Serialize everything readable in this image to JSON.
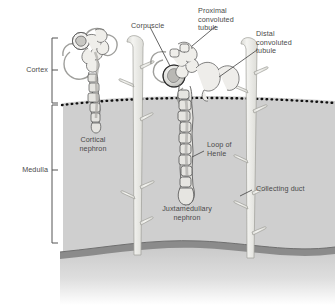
{
  "figure": {
    "type": "anatomical-diagram"
  },
  "regions": {
    "cortex": {
      "label": "Cortex",
      "fill": "#ffffff"
    },
    "medulla": {
      "label": "Medulla",
      "fill": "#cfcfcf"
    },
    "capsule": {
      "fill": "#8d8d8d"
    },
    "boundary": {
      "style": "dotted",
      "color": "#1a1a1a"
    }
  },
  "labels": {
    "cortex": "Cortex",
    "medulla": "Medulla",
    "corpuscle": "Corpuscle",
    "proximal_convoluted_tubule": "Proximal\nconvoluted\ntubule",
    "distal_convoluted_tubule": "Distal\nconvoluted\ntubule",
    "cortical_nephron": "Cortical\nnephron",
    "juxtamedullary_nephron": "Juxtamedullary\nnephron",
    "loop_of_henle": "Loop of\nHenle",
    "collecting_duct": "Collecting duct"
  },
  "colors": {
    "outline": "#4f4f4f",
    "tubule_fill": "#eceae6",
    "tubule_dark": "#9a9a9a",
    "duct_fill": "#efefeb",
    "text": "#4a4a4a",
    "bracket": "#555555"
  }
}
